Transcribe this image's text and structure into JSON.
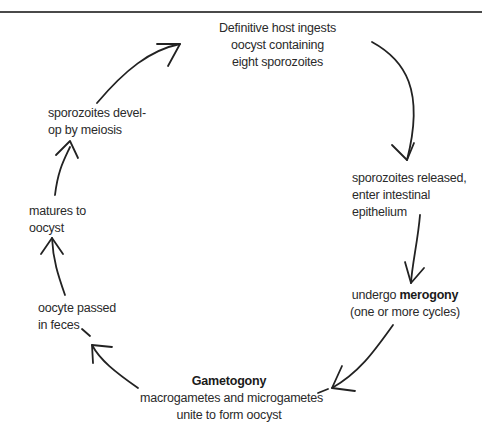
{
  "diagram": {
    "type": "life-cycle",
    "title": "",
    "stages": [
      {
        "id": "ingest",
        "lines": [
          "Definitive host ingests",
          "oocyst containing",
          "eight sporozoites"
        ]
      },
      {
        "id": "release",
        "lines": [
          "sporozoites released,",
          "enter intestinal",
          "epithelium"
        ]
      },
      {
        "id": "merogony",
        "prefix": "undergo ",
        "bold": "merogony",
        "lines2": "(one or more cycles)"
      },
      {
        "id": "gametogony",
        "bold": "Gametogony",
        "lines": [
          "macrogametes and microgametes",
          "unite to form oocyst"
        ]
      },
      {
        "id": "passed",
        "lines": [
          "oocyte passed",
          "in feces"
        ]
      },
      {
        "id": "matures",
        "lines": [
          "matures to",
          "oocyst"
        ]
      },
      {
        "id": "meiosis",
        "lines": [
          "sporozoites devel-",
          "op by meiosis"
        ]
      }
    ],
    "arrows": [
      {
        "from": "ingest",
        "to": "release"
      },
      {
        "from": "release",
        "to": "merogony"
      },
      {
        "from": "merogony",
        "to": "gametogony"
      },
      {
        "from": "gametogony",
        "to": "passed"
      },
      {
        "from": "passed",
        "to": "matures"
      },
      {
        "from": "matures",
        "to": "meiosis"
      },
      {
        "from": "meiosis",
        "to": "ingest"
      }
    ],
    "colors": {
      "text": "#2a2a2a",
      "arrow": "#222222",
      "rule": "#4a4a4a",
      "background": "#ffffff"
    }
  }
}
